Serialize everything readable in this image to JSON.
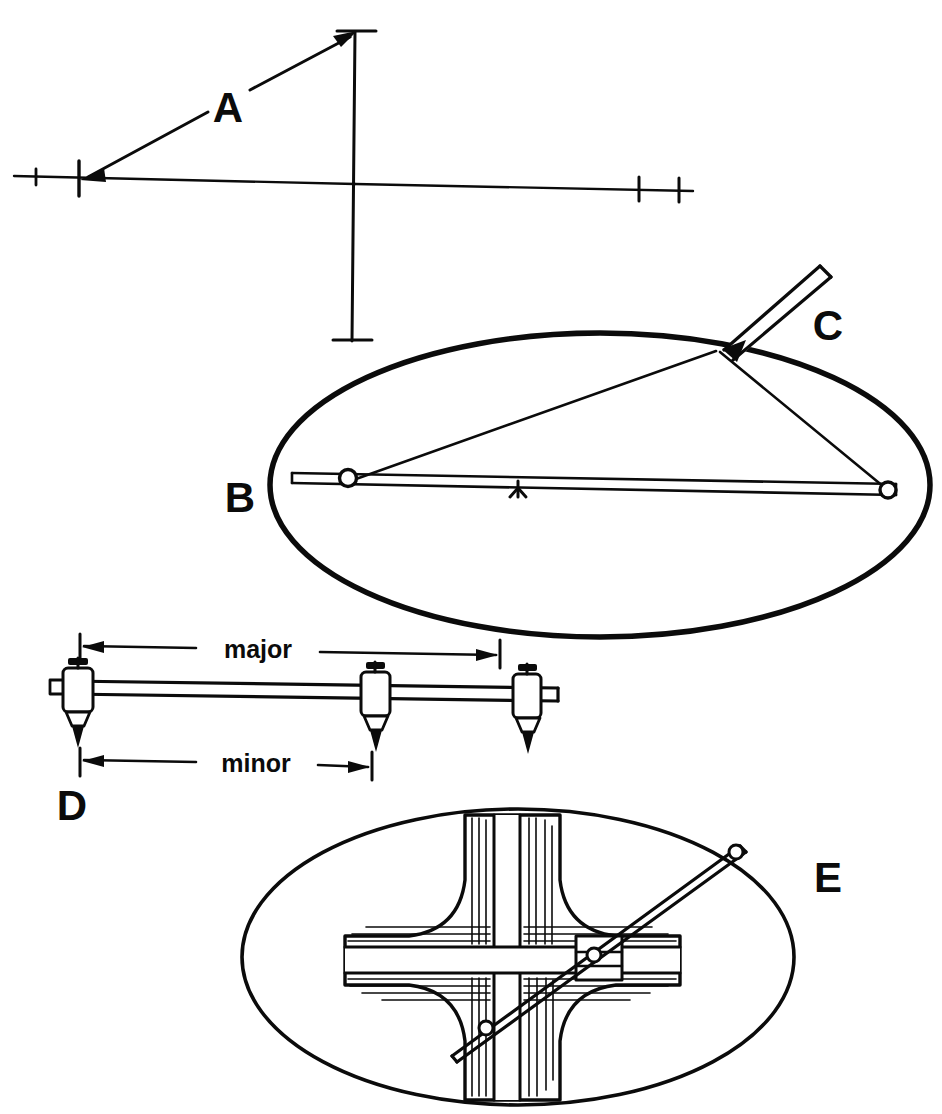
{
  "figure": {
    "background_color": "#ffffff",
    "ink_color": "#0b0b0b",
    "width": 942,
    "height": 1114
  },
  "panels": [
    {
      "id": "A",
      "label": "A",
      "label_x": 228,
      "label_y": 122,
      "caption": "Major and minor axes laid out with tick marks; arrow indicates half-minor-axis distance transferred from the axis endpoint to the minor axis end."
    },
    {
      "id": "B",
      "label": "B",
      "label_x": 240,
      "label_y": 512,
      "caption": "Ellipse drawn by the string-and-two-pins (foci) method; pins set on the major axis."
    },
    {
      "id": "C",
      "label": "C",
      "label_x": 828,
      "label_y": 340,
      "caption": "Pencil held against the taut string traces the ellipse outline."
    },
    {
      "id": "D",
      "label": "D",
      "label_x": 72,
      "label_y": 820,
      "caption": "Trammel bar with three adjustable pin holders set to the major and minor semi-axis lengths."
    },
    {
      "id": "E",
      "label": "E",
      "label_x": 828,
      "label_y": 892,
      "caption": "Ellipsograph: cruciform grooved guide with trammel arm swinging to scribe the ellipse."
    }
  ],
  "dimension_labels": [
    {
      "id": "major",
      "text": "major",
      "x": 238,
      "y": 652
    },
    {
      "id": "minor",
      "text": "minor",
      "x": 238,
      "y": 766
    }
  ],
  "axes_diagram": {
    "horizontal_axis": {
      "x1": 14,
      "y1": 177,
      "x2": 692,
      "y2": 190
    },
    "vertical_axis": {
      "x1": 355,
      "y1": 30,
      "x2": 352,
      "y2": 342
    },
    "tick_marks": [
      {
        "id": "tick-left-outer",
        "x": 36,
        "y": 177,
        "size": 9,
        "orientation": "vertical"
      },
      {
        "id": "tick-left-major-end",
        "x": 79,
        "y": 178,
        "size": 17,
        "orientation": "vertical"
      },
      {
        "id": "tick-right-inner",
        "x": 639,
        "y": 188,
        "size": 12,
        "orientation": "vertical"
      },
      {
        "id": "tick-right-outer",
        "x": 679,
        "y": 189,
        "size": 12,
        "orientation": "vertical"
      },
      {
        "id": "tick-top",
        "x": 355,
        "y": 31,
        "size": 13,
        "orientation": "horizontal"
      },
      {
        "id": "tick-bottom",
        "x": 352,
        "y": 340,
        "size": 13,
        "orientation": "horizontal"
      }
    ],
    "transfer_arrow": {
      "from_x": 353,
      "from_y": 35,
      "to_x": 84,
      "to_y": 179,
      "label_gap": {
        "x": 212,
        "y": 106,
        "width": 38,
        "height": 34
      }
    }
  },
  "string_method": {
    "ellipse": {
      "cx": 600,
      "cy": 485,
      "rx": 330,
      "ry": 152
    },
    "focus_left": {
      "x": 348,
      "y": 481,
      "r": 9
    },
    "focus_right": {
      "x": 888,
      "y": 491,
      "r": 9
    },
    "center_marker": {
      "x": 518,
      "y": 488
    },
    "pencil_point": {
      "x": 722,
      "y": 348
    },
    "pencil_tail": {
      "x": 832,
      "y": 262
    },
    "string_segments": [
      {
        "from": "focus_left",
        "to": "pencil_point"
      },
      {
        "from": "focus_right",
        "to": "pencil_point"
      },
      {
        "from": "focus_left",
        "to": "focus_right"
      }
    ]
  },
  "trammel": {
    "bar": {
      "x1": 66,
      "y1": 686,
      "x2": 560,
      "y2": 692
    },
    "holders": [
      {
        "id": "holder-major-pin",
        "x": 77,
        "y": 690
      },
      {
        "id": "holder-minor-pin",
        "x": 375,
        "y": 694
      },
      {
        "id": "holder-end-pin",
        "x": 527,
        "y": 696
      }
    ],
    "major_dimension": {
      "x1": 80,
      "y1": 645,
      "x2": 500,
      "y2": 655
    },
    "minor_dimension": {
      "x1": 80,
      "y1": 758,
      "x2": 370,
      "y2": 766
    }
  },
  "ellipsograph": {
    "ellipse": {
      "cx": 518,
      "cy": 957,
      "rx": 276,
      "ry": 148
    },
    "cross_center": {
      "x": 512,
      "y": 958
    },
    "arm": {
      "x1": 452,
      "y1": 1052,
      "x2": 742,
      "y2": 848
    },
    "pivots": [
      {
        "id": "pivot-outer-scribe",
        "x": 736,
        "y": 852,
        "r": 7
      },
      {
        "id": "pivot-slider-upper",
        "x": 594,
        "y": 955,
        "r": 7
      },
      {
        "id": "pivot-slider-lower",
        "x": 486,
        "y": 1028,
        "r": 7
      }
    ]
  }
}
